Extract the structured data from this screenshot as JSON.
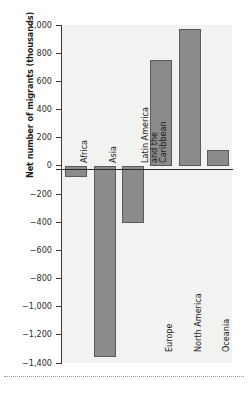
{
  "chart_data": {
    "type": "bar",
    "title": "",
    "subtitle": "",
    "xlabel": "",
    "ylabel": "Net number of migrants (thousands)",
    "categories": [
      "Africa",
      "Asia",
      "Latin America and the Caribbean",
      "Europe",
      "North America",
      "Oceania"
    ],
    "values": [
      -80,
      -1360,
      -405,
      755,
      975,
      115
    ],
    "ylim": [
      -1400,
      1000
    ],
    "ytick_labels": [
      "1,000",
      "800",
      "600",
      "400",
      "200",
      "0",
      "−200",
      "−400",
      "−600",
      "−800",
      "−1,000",
      "−1,200",
      "−1,400"
    ],
    "ytick_values": [
      1000,
      800,
      600,
      400,
      200,
      0,
      -200,
      -400,
      -600,
      -800,
      -1000,
      -1200,
      -1400
    ],
    "grid": false,
    "legend": null,
    "bar_color": "#8b8b8b",
    "bar_border_color": "#5a5a5a",
    "plot_background": "#f2f2f0",
    "axis_color": "#3a3a3a"
  }
}
